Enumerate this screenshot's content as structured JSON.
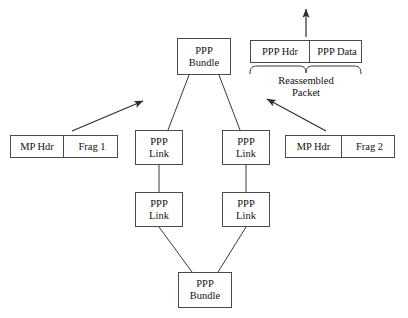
{
  "diagram": {
    "colors": {
      "background": "#ffffff",
      "box_border": "#4a4a4a",
      "line": "#3a3a3a",
      "text": "#111111"
    },
    "nodes": [
      {
        "id": "ppp-bundle-top",
        "name": "ppp-bundle-top",
        "lines": [
          "PPP",
          "Bundle"
        ],
        "x": 177,
        "y": 38,
        "w": 54,
        "h": 37
      },
      {
        "id": "ppp-link-left-upper",
        "name": "ppp-link-left-upper",
        "lines": [
          "PPP",
          "Link"
        ],
        "x": 135,
        "y": 130,
        "w": 48,
        "h": 35
      },
      {
        "id": "ppp-link-right-upper",
        "name": "ppp-link-right-upper",
        "lines": [
          "PPP",
          "Link"
        ],
        "x": 222,
        "y": 130,
        "w": 48,
        "h": 35
      },
      {
        "id": "ppp-link-left-lower",
        "name": "ppp-link-left-lower",
        "lines": [
          "PPP",
          "Link"
        ],
        "x": 135,
        "y": 192,
        "w": 48,
        "h": 35
      },
      {
        "id": "ppp-link-right-lower",
        "name": "ppp-link-right-lower",
        "lines": [
          "PPP",
          "Link"
        ],
        "x": 222,
        "y": 192,
        "w": 48,
        "h": 35
      },
      {
        "id": "ppp-bundle-bottom",
        "name": "ppp-bundle-bottom",
        "lines": [
          "PPP",
          "Bundle"
        ],
        "x": 178,
        "y": 272,
        "w": 54,
        "h": 36
      }
    ],
    "segmented_boxes": [
      {
        "id": "reassembled-packet-box",
        "name": "reassembled-packet-box",
        "x": 250,
        "y": 40,
        "w": 112,
        "h": 23,
        "segments": [
          {
            "name": "ppp-hdr-segment",
            "label": "PPP Hdr",
            "width": 58
          },
          {
            "name": "ppp-data-segment",
            "label": "PPP Data",
            "width": 54
          }
        ]
      },
      {
        "id": "fragment-1-box",
        "name": "fragment-1-box",
        "x": 10,
        "y": 135,
        "w": 108,
        "h": 23,
        "segments": [
          {
            "name": "mp-hdr-segment-1",
            "label": "MP Hdr",
            "width": 52
          },
          {
            "name": "frag-1-segment",
            "label": "Frag 1",
            "width": 56
          }
        ]
      },
      {
        "id": "fragment-2-box",
        "name": "fragment-2-box",
        "x": 285,
        "y": 135,
        "w": 110,
        "h": 23,
        "segments": [
          {
            "name": "mp-hdr-segment-2",
            "label": "MP Hdr",
            "width": 55
          },
          {
            "name": "frag-2-segment",
            "label": "Frag 2",
            "width": 55
          }
        ]
      }
    ],
    "captions": [
      {
        "id": "reassembled-packet-caption",
        "name": "reassembled-packet-caption",
        "lines": [
          "Reassembled",
          "Packet"
        ],
        "x": 256,
        "y": 75,
        "w": 100
      }
    ],
    "brace": {
      "name": "reassembled-packet-brace",
      "x_start": 250,
      "x_end": 361,
      "y": 66,
      "notch_x": 306
    },
    "arrows": [
      {
        "name": "frag-1-inbound-arrow",
        "x1": 72,
        "y1": 131,
        "x2": 143,
        "y2": 101
      },
      {
        "name": "frag-2-inbound-arrow",
        "x1": 326,
        "y1": 131,
        "x2": 267,
        "y2": 99
      },
      {
        "name": "reassembled-packet-outbound-arrow",
        "x1": 306,
        "y1": 37,
        "x2": 306,
        "y2": 9
      }
    ],
    "connectors": [
      {
        "name": "connector-bundle-top-to-link-left",
        "x1": 189,
        "y1": 75,
        "x2": 168,
        "y2": 130
      },
      {
        "name": "connector-bundle-top-to-link-right",
        "x1": 219,
        "y1": 75,
        "x2": 240,
        "y2": 130
      },
      {
        "name": "connector-link-left-upper-to-lower",
        "x1": 159,
        "y1": 165,
        "x2": 159,
        "y2": 192
      },
      {
        "name": "connector-link-right-upper-to-lower",
        "x1": 246,
        "y1": 165,
        "x2": 246,
        "y2": 192
      },
      {
        "name": "connector-link-left-lower-to-bundle-bottom",
        "x1": 159,
        "y1": 227,
        "x2": 192,
        "y2": 272
      },
      {
        "name": "connector-link-right-lower-to-bundle-bottom",
        "x1": 246,
        "y1": 227,
        "x2": 218,
        "y2": 272
      }
    ]
  }
}
